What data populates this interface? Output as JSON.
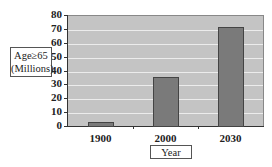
{
  "chart_data": {
    "type": "bar",
    "title": "",
    "xlabel": "Year",
    "ylabel": "Age≥65 (Millions)",
    "categories": [
      "1900",
      "2000",
      "2030"
    ],
    "values": [
      3,
      35,
      71
    ],
    "ylim": [
      0,
      80
    ],
    "yticks": [
      0,
      10,
      20,
      30,
      40,
      50,
      60,
      70,
      80
    ],
    "grid": true,
    "legend": null,
    "colors": {
      "bar": "#7a7a7a",
      "plot_background": "#c4c4c4",
      "grid": "#ececec"
    }
  },
  "labels": {
    "ytitle_line1": "Age≥65",
    "ytitle_line2": "(Millions)",
    "xtitle": "Year",
    "yticks": [
      "0",
      "10",
      "20",
      "30",
      "40",
      "50",
      "60",
      "70",
      "80"
    ],
    "xticks": [
      "1900",
      "2000",
      "2030"
    ]
  }
}
